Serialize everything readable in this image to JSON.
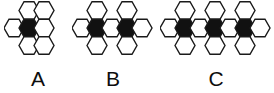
{
  "image": {
    "title": "Hexagon cluster sequence A B C",
    "background_color": "#ffffff",
    "hex_fill_white": "#ffffff",
    "hex_fill_black": "#111111",
    "hex_stroke_color": "#1a1a1a",
    "label_color": "#0d0d0d"
  },
  "figures": [
    {
      "label": "A",
      "hex_count": 7,
      "black_count": 1,
      "white_count": 6,
      "description": "one black hexagon surrounded by six white hexagons",
      "cells": [
        {
          "col": 1,
          "row": -1,
          "fill": "white"
        },
        {
          "col": 2,
          "row": -1,
          "fill": "white"
        },
        {
          "col": 0,
          "row": 0,
          "fill": "white"
        },
        {
          "col": 1,
          "row": 0,
          "fill": "black"
        },
        {
          "col": 2,
          "row": 0,
          "fill": "white"
        },
        {
          "col": 1,
          "row": 1,
          "fill": "white"
        },
        {
          "col": 2,
          "row": 1,
          "fill": "white"
        }
      ]
    },
    {
      "label": "B",
      "hex_count": 10,
      "black_count": 2,
      "white_count": 8,
      "description": "two black hexagons in the middle row with white hexagons around them",
      "cells": [
        {
          "col": 1,
          "row": -1,
          "fill": "white"
        },
        {
          "col": 3,
          "row": -1,
          "fill": "white"
        },
        {
          "col": 0,
          "row": 0,
          "fill": "white"
        },
        {
          "col": 1,
          "row": 0,
          "fill": "black"
        },
        {
          "col": 2,
          "row": 0,
          "fill": "white"
        },
        {
          "col": 3,
          "row": 0,
          "fill": "black"
        },
        {
          "col": 4,
          "row": 0,
          "fill": "white"
        },
        {
          "col": 1,
          "row": 1,
          "fill": "white"
        },
        {
          "col": 3,
          "row": 1,
          "fill": "white"
        }
      ]
    },
    {
      "label": "C",
      "hex_count": 13,
      "black_count": 3,
      "white_count": 10,
      "description": "three black hexagons in the middle row with white hexagons around them",
      "cells": [
        {
          "col": 1,
          "row": -1,
          "fill": "white"
        },
        {
          "col": 3,
          "row": -1,
          "fill": "white"
        },
        {
          "col": 5,
          "row": -1,
          "fill": "white"
        },
        {
          "col": 0,
          "row": 0,
          "fill": "white"
        },
        {
          "col": 1,
          "row": 0,
          "fill": "black"
        },
        {
          "col": 2,
          "row": 0,
          "fill": "white"
        },
        {
          "col": 3,
          "row": 0,
          "fill": "black"
        },
        {
          "col": 4,
          "row": 0,
          "fill": "white"
        },
        {
          "col": 5,
          "row": 0,
          "fill": "black"
        },
        {
          "col": 6,
          "row": 0,
          "fill": "white"
        },
        {
          "col": 1,
          "row": 1,
          "fill": "white"
        },
        {
          "col": 3,
          "row": 1,
          "fill": "white"
        },
        {
          "col": 5,
          "row": 1,
          "fill": "white"
        }
      ]
    }
  ],
  "geometry": {
    "hex_width": 20,
    "hex_height": 17.5,
    "col_step": 15,
    "row_step": 17.5,
    "stroke_width": 1.4,
    "origin_x": 10,
    "origin_y": 28
  }
}
